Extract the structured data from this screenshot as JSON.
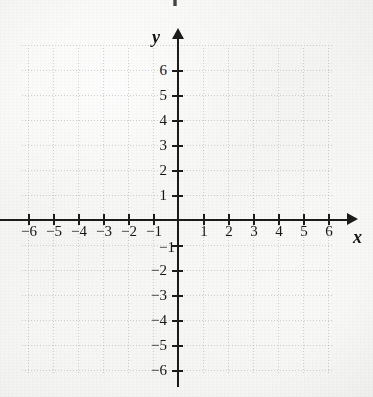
{
  "figure": {
    "kind": "cartesian-coordinate-plane",
    "x_axis_name": "x",
    "y_axis_name": "y",
    "ink_color": "#1b1b1b",
    "paper_color": "#f7f7f5",
    "grid_color": "#7d7d7d"
  },
  "chart_data": {
    "type": "scatter",
    "title": "",
    "subtitle": "",
    "xlabel": "x",
    "ylabel": "y",
    "xlim": [
      -7,
      7
    ],
    "ylim": [
      -7,
      7
    ],
    "xticks": [
      -6,
      -5,
      -4,
      -3,
      -2,
      -1,
      1,
      2,
      3,
      4,
      5,
      6
    ],
    "yticks": [
      6,
      5,
      4,
      3,
      2,
      1,
      -1,
      -2,
      -3,
      -4,
      -5,
      -6
    ],
    "xtick_labels": [
      "−6",
      "−5",
      "−4",
      "−3",
      "−2",
      "−1",
      "1",
      "2",
      "3",
      "4",
      "5",
      "6"
    ],
    "ytick_labels": [
      "6",
      "5",
      "4",
      "3",
      "2",
      "1",
      "−1",
      "−2",
      "−3",
      "−4",
      "−5",
      "−6"
    ],
    "tick_interval": 1,
    "grid": true,
    "grid_style": "dotted",
    "legend": null,
    "series": [],
    "annotations": [],
    "axis_arrows": {
      "x_positive": true,
      "x_negative": false,
      "y_positive": true,
      "y_negative": false
    }
  },
  "xticks": [
    {
      "value": -6,
      "label": "−6",
      "px": 28
    },
    {
      "value": -5,
      "label": "−5",
      "px": 53
    },
    {
      "value": -4,
      "label": "−4",
      "px": 78
    },
    {
      "value": -3,
      "label": "−3",
      "px": 103
    },
    {
      "value": -2,
      "label": "−2",
      "px": 128
    },
    {
      "value": -1,
      "label": "−1",
      "px": 153
    },
    {
      "value": 1,
      "label": "1",
      "px": 203
    },
    {
      "value": 2,
      "label": "2",
      "px": 228
    },
    {
      "value": 3,
      "label": "3",
      "px": 253
    },
    {
      "value": 4,
      "label": "4",
      "px": 278
    },
    {
      "value": 5,
      "label": "5",
      "px": 303
    },
    {
      "value": 6,
      "label": "6",
      "px": 328
    }
  ],
  "yticks": [
    {
      "value": 6,
      "label": "6",
      "px": 70
    },
    {
      "value": 5,
      "label": "5",
      "px": 95
    },
    {
      "value": 4,
      "label": "4",
      "px": 120
    },
    {
      "value": 3,
      "label": "3",
      "px": 145
    },
    {
      "value": 2,
      "label": "2",
      "px": 170
    },
    {
      "value": 1,
      "label": "1",
      "px": 195
    },
    {
      "value": -1,
      "label": "−1",
      "px": 245
    },
    {
      "value": -2,
      "label": "−2",
      "px": 270
    },
    {
      "value": -3,
      "label": "−3",
      "px": 295
    },
    {
      "value": -4,
      "label": "−4",
      "px": 320
    },
    {
      "value": -5,
      "label": "−5",
      "px": 345
    },
    {
      "value": -6,
      "label": "−6",
      "px": 370
    }
  ]
}
